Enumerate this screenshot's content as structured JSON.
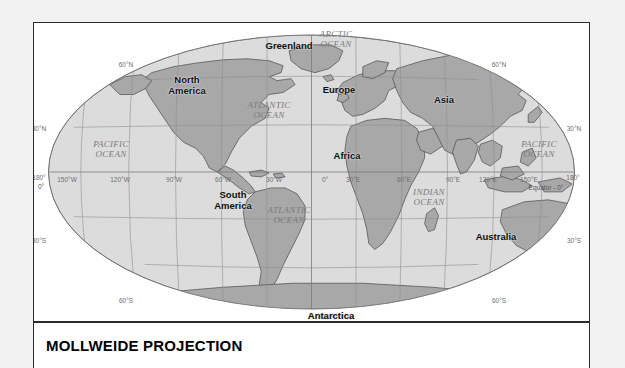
{
  "title": "MOLLWEIDE PROJECTION",
  "map": {
    "projection_name": "Mollweide",
    "colors": {
      "ocean_fill": "#dcdcdc",
      "land_fill": "#a8a8a8",
      "land_stroke": "#4a4a4a",
      "graticule": "#8f8f8f",
      "outline": "#6f6f6f",
      "panel_border": "#2b2b2b",
      "page_background": "#f2f2f2",
      "panel_background": "#ffffff"
    },
    "continents": [
      {
        "name": "North America",
        "lines": [
          "North",
          "America"
        ],
        "x": 186,
        "y": 84
      },
      {
        "name": "South America",
        "lines": [
          "South",
          "America"
        ],
        "x": 232,
        "y": 199
      },
      {
        "name": "Europe",
        "lines": [
          "Europe"
        ],
        "x": 338,
        "y": 89
      },
      {
        "name": "Africa",
        "lines": [
          "Africa"
        ],
        "x": 346,
        "y": 155
      },
      {
        "name": "Asia",
        "lines": [
          "Asia"
        ],
        "x": 443,
        "y": 99
      },
      {
        "name": "Australia",
        "lines": [
          "Australia"
        ],
        "x": 495,
        "y": 236
      },
      {
        "name": "Antarctica",
        "lines": [
          "Antarctica"
        ],
        "x": 330,
        "y": 315
      },
      {
        "name": "Greenland",
        "lines": [
          "Greenland"
        ],
        "x": 288,
        "y": 45
      }
    ],
    "oceans": [
      {
        "name": "Arctic Ocean",
        "lines": [
          "ARCTIC",
          "OCEAN"
        ],
        "x": 335,
        "y": 38
      },
      {
        "name": "Atlantic Ocean North",
        "lines": [
          "ATLANTIC",
          "OCEAN"
        ],
        "x": 268,
        "y": 109
      },
      {
        "name": "Atlantic Ocean South",
        "lines": [
          "ATLANTIC",
          "OCEAN"
        ],
        "x": 288,
        "y": 214
      },
      {
        "name": "Pacific Ocean West",
        "lines": [
          "PACIFIC",
          "OCEAN"
        ],
        "x": 110,
        "y": 148
      },
      {
        "name": "Pacific Ocean East",
        "lines": [
          "PACIFIC",
          "OCEAN"
        ],
        "x": 538,
        "y": 148
      },
      {
        "name": "Indian Ocean",
        "lines": [
          "INDIAN",
          "OCEAN"
        ],
        "x": 428,
        "y": 196
      }
    ],
    "parallel_labels": [
      {
        "text": "60°N",
        "x": 125,
        "y": 63,
        "side": "left"
      },
      {
        "text": "30°N",
        "x": 38,
        "y": 127,
        "side": "left"
      },
      {
        "text": "30°S",
        "x": 38,
        "y": 239,
        "side": "left"
      },
      {
        "text": "60°S",
        "x": 125,
        "y": 299,
        "side": "left"
      },
      {
        "text": "60°N",
        "x": 498,
        "y": 63,
        "side": "right"
      },
      {
        "text": "30°N",
        "x": 573,
        "y": 127,
        "side": "right"
      },
      {
        "text": "30°S",
        "x": 573,
        "y": 239,
        "side": "right"
      },
      {
        "text": "60°S",
        "x": 498,
        "y": 299,
        "side": "right"
      }
    ],
    "meridian_labels": [
      {
        "text": "180°",
        "x": 38,
        "y": 176
      },
      {
        "text": "150°W",
        "x": 66,
        "y": 178
      },
      {
        "text": "120°W",
        "x": 119,
        "y": 178
      },
      {
        "text": "90°W",
        "x": 173,
        "y": 178
      },
      {
        "text": "60°W",
        "x": 222,
        "y": 178
      },
      {
        "text": "30°W",
        "x": 273,
        "y": 178
      },
      {
        "text": "0°",
        "x": 324,
        "y": 178
      },
      {
        "text": "30°E",
        "x": 352,
        "y": 178
      },
      {
        "text": "60°E",
        "x": 403,
        "y": 178
      },
      {
        "text": "90°E",
        "x": 452,
        "y": 178
      },
      {
        "text": "120°E",
        "x": 487,
        "y": 178
      },
      {
        "text": "150°E",
        "x": 528,
        "y": 178
      },
      {
        "text": "180°",
        "x": 572,
        "y": 176
      }
    ],
    "special_labels": [
      {
        "name": "prime-meridian-zero",
        "text": "0°",
        "x": 40,
        "y": 185
      },
      {
        "name": "equator",
        "text": "Equator - 0°",
        "x": 545,
        "y": 186
      }
    ]
  }
}
